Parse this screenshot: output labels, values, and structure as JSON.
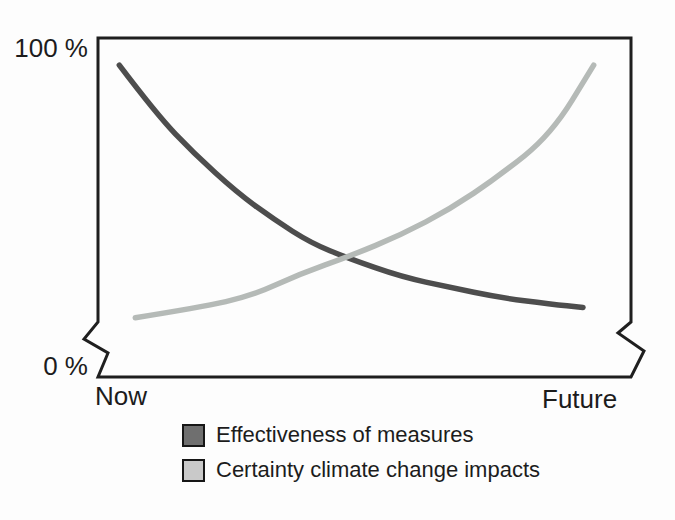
{
  "figure": {
    "background": "#fdfdfd",
    "frame_color": "#1f1f1f",
    "text_color": "#1c1c1c"
  },
  "chart_data": {
    "type": "line",
    "title": "",
    "xlabel": "",
    "ylabel": "",
    "x_tick_labels": [
      "Now",
      "Future"
    ],
    "y_tick_labels": [
      "0 %",
      "100 %"
    ],
    "ylim": [
      0,
      100
    ],
    "y_unit": "%",
    "grid": false,
    "axis_break_near_zero": true,
    "legend_position": "bottom",
    "series": [
      {
        "name": "Effectiveness of measures",
        "color": "#4d4d4d",
        "swatch_color": "#6f6f6f",
        "x": [
          0.04,
          0.11,
          0.18,
          0.26,
          0.33,
          0.4,
          0.47,
          0.57,
          0.66,
          0.75,
          0.85,
          0.91
        ],
        "y": [
          92,
          77.5,
          66,
          54.5,
          46.5,
          39.5,
          35,
          29.5,
          26.5,
          23.5,
          21.5,
          20.5
        ]
      },
      {
        "name": "Certainty climate change impacts",
        "color": "#b5bab7",
        "swatch_color": "#c9c9c9",
        "x": [
          0.07,
          0.19,
          0.29,
          0.38,
          0.47,
          0.57,
          0.66,
          0.75,
          0.85,
          0.93
        ],
        "y": [
          17.5,
          20.5,
          24,
          30.5,
          35.5,
          42,
          49.5,
          59,
          71.5,
          92
        ]
      }
    ]
  }
}
